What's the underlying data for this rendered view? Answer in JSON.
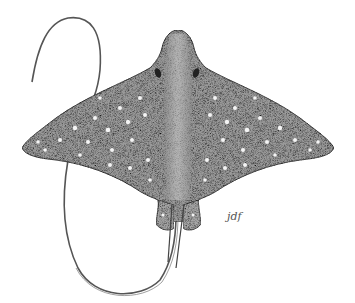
{
  "image": {
    "subject": "spotted eagle ray illustration",
    "style": "stippled pen-and-ink drawing",
    "signature": "jdf",
    "colors": {
      "background": "#ffffff",
      "body_fill": "#9a9a9a",
      "body_dark": "#6e6e6e",
      "spots": "#f2f2f2",
      "outline": "#3a3a3a"
    }
  }
}
